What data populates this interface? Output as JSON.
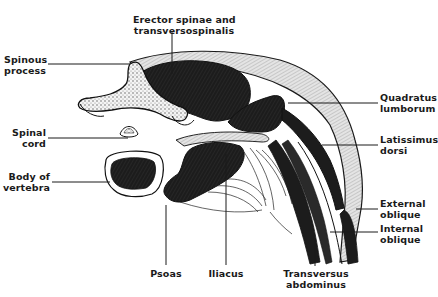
{
  "diagram": {
    "labels": {
      "erector": {
        "line1": "Erector spinae and",
        "line2": "transversospinalis"
      },
      "spinous": {
        "line1": "Spinous",
        "line2": "process"
      },
      "spinal_cord": {
        "line1": "Spinal",
        "line2": "cord"
      },
      "body_vertebra": {
        "line1": "Body of",
        "line2": "vertebra"
      },
      "quadratus": {
        "line1": "Quadratus",
        "line2": "lumborum"
      },
      "latissimus": {
        "line1": "Latissimus",
        "line2": "dorsi"
      },
      "external_oblique": {
        "line1": "External",
        "line2": "oblique"
      },
      "internal_oblique": {
        "line1": "Internal",
        "line2": "oblique"
      },
      "psoas": {
        "line1": "Psoas"
      },
      "iliacus": {
        "line1": "Iliacus"
      },
      "transversus": {
        "line1": "Transversus",
        "line2": "abdominus"
      }
    },
    "colors": {
      "ink": "#1a1a1a",
      "muscle_dark": "#1c1c1c",
      "fascia": "#d8d8d8",
      "paper": "#ffffff"
    }
  }
}
